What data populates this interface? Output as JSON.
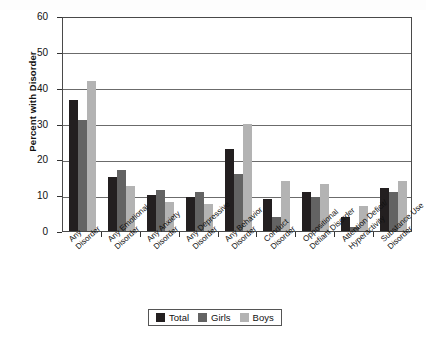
{
  "chart_data": {
    "type": "bar",
    "title": "",
    "xlabel": "",
    "ylabel": "Percent with Disorder",
    "ylim": [
      0,
      60
    ],
    "yticks": [
      0,
      10,
      20,
      30,
      40,
      50,
      60
    ],
    "grid": true,
    "legend_position": "bottom",
    "categories": [
      "Any Disorder",
      "Any Emotional Disorder",
      "Any Anxiety Disorder",
      "Any Depressive Disorder",
      "Any Behavior Disorder",
      "Conduct Disorder",
      "Oppositional Defiant Disorder",
      "Attention Deficit/Hyperactivity",
      "Substance Use Disorder"
    ],
    "category_lines": [
      [
        "Any",
        "Disorder"
      ],
      [
        "Any Emotional",
        "Disorder"
      ],
      [
        "Any Anxiety",
        "Disorder"
      ],
      [
        "Any Depressive",
        "Disorder"
      ],
      [
        "Any Behavior",
        "Disorder"
      ],
      [
        "Conduct",
        "Disorder"
      ],
      [
        "Oppositional",
        "Defiant Disorder"
      ],
      [
        "Attention Deficit/",
        "Hyperactivity"
      ],
      [
        "Substance Use",
        "Disorder"
      ]
    ],
    "series": [
      {
        "name": "Total",
        "color": "#231f20",
        "values": [
          36.5,
          15,
          10,
          9.5,
          23,
          9,
          11,
          4,
          12
        ]
      },
      {
        "name": "Girls",
        "color": "#636363",
        "values": [
          31,
          17,
          11.5,
          11,
          16,
          4,
          9.5,
          1,
          11
        ]
      },
      {
        "name": "Boys",
        "color": "#b3b3b3",
        "values": [
          42,
          12.5,
          8,
          7.5,
          30,
          14,
          13,
          7,
          14
        ]
      }
    ]
  },
  "legend": {
    "items": [
      {
        "label": "Total"
      },
      {
        "label": "Girls"
      },
      {
        "label": "Boys"
      }
    ]
  },
  "axis": {
    "y_title": "Percent with Disorder",
    "y_tick_labels": [
      "60",
      "50",
      "40",
      "30",
      "20",
      "10",
      "0"
    ]
  }
}
